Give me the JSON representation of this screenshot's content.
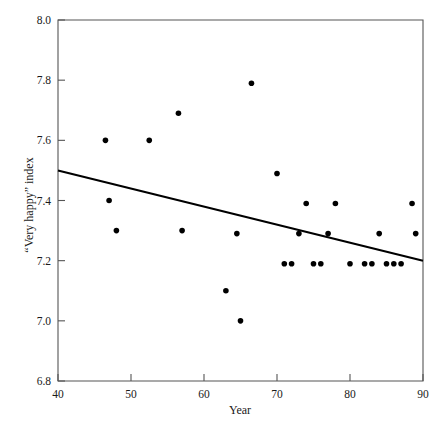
{
  "chart_data": {
    "type": "scatter",
    "title": "",
    "xlabel": "Year",
    "ylabel": "“Very happy” index",
    "xlim": [
      40,
      90
    ],
    "ylim": [
      6.8,
      8.0
    ],
    "xticks": [
      "40",
      "50",
      "60",
      "70",
      "80",
      "90"
    ],
    "xtick_values": [
      40,
      50,
      60,
      70,
      80,
      90
    ],
    "yticks": [
      "6.8",
      "7.0",
      "7.2",
      "7.4",
      "7.6",
      "7.8",
      "8.0"
    ],
    "ytick_values": [
      6.8,
      7.0,
      7.2,
      7.4,
      7.6,
      7.8,
      8.0
    ],
    "grid": false,
    "legend": false,
    "x": [
      46.5,
      47.0,
      48.0,
      52.5,
      56.5,
      57.0,
      63.0,
      64.5,
      65.0,
      66.5,
      70.0,
      71.0,
      72.0,
      73.0,
      74.0,
      75.0,
      76.0,
      77.0,
      78.0,
      80.0,
      82.0,
      83.0,
      84.0,
      85.0,
      86.0,
      87.0,
      88.5,
      89.0
    ],
    "y": [
      7.6,
      7.4,
      7.3,
      7.6,
      7.69,
      7.3,
      7.1,
      7.29,
      7.0,
      7.79,
      7.49,
      7.19,
      7.19,
      7.29,
      7.39,
      7.19,
      7.19,
      7.29,
      7.39,
      7.19,
      7.19,
      7.19,
      7.29,
      7.19,
      7.19,
      7.19,
      7.39,
      7.29
    ],
    "series": [
      {
        "name": "“Very happy” index",
        "marker": "filled-circle",
        "color": "#000000",
        "points": [
          {
            "x": 46.5,
            "y": 7.6
          },
          {
            "x": 47.0,
            "y": 7.4
          },
          {
            "x": 48.0,
            "y": 7.3
          },
          {
            "x": 52.5,
            "y": 7.6
          },
          {
            "x": 56.5,
            "y": 7.69
          },
          {
            "x": 57.0,
            "y": 7.3
          },
          {
            "x": 63.0,
            "y": 7.1
          },
          {
            "x": 64.5,
            "y": 7.29
          },
          {
            "x": 65.0,
            "y": 7.0
          },
          {
            "x": 66.5,
            "y": 7.79
          },
          {
            "x": 70.0,
            "y": 7.49
          },
          {
            "x": 71.0,
            "y": 7.19
          },
          {
            "x": 72.0,
            "y": 7.19
          },
          {
            "x": 73.0,
            "y": 7.29
          },
          {
            "x": 74.0,
            "y": 7.39
          },
          {
            "x": 75.0,
            "y": 7.19
          },
          {
            "x": 76.0,
            "y": 7.19
          },
          {
            "x": 77.0,
            "y": 7.29
          },
          {
            "x": 78.0,
            "y": 7.39
          },
          {
            "x": 80.0,
            "y": 7.19
          },
          {
            "x": 82.0,
            "y": 7.19
          },
          {
            "x": 83.0,
            "y": 7.19
          },
          {
            "x": 84.0,
            "y": 7.29
          },
          {
            "x": 85.0,
            "y": 7.19
          },
          {
            "x": 86.0,
            "y": 7.19
          },
          {
            "x": 87.0,
            "y": 7.19
          },
          {
            "x": 88.5,
            "y": 7.39
          },
          {
            "x": 89.0,
            "y": 7.29
          }
        ]
      }
    ],
    "trend_line": {
      "name": "linear-fit",
      "color": "#000000",
      "x0": 40,
      "y0": 7.5,
      "x1": 90,
      "y1": 7.2
    }
  }
}
